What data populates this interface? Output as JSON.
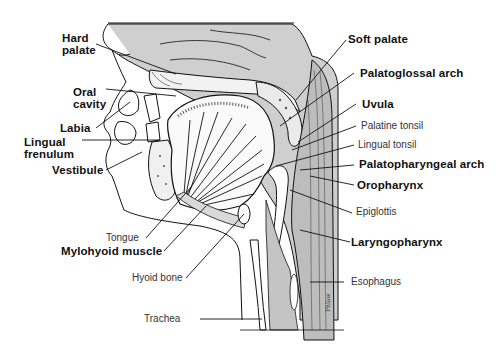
{
  "diagram": {
    "labels_left": [
      {
        "id": "hard-palate",
        "text": "Hard\npalate"
      },
      {
        "id": "oral-cavity",
        "text": "Oral\ncavity"
      },
      {
        "id": "labia",
        "text": "Labia"
      },
      {
        "id": "lingual-frenulum",
        "text": "Lingual\nfrenulum"
      },
      {
        "id": "vestibule",
        "text": "Vestibule"
      },
      {
        "id": "tongue",
        "text": "Tongue"
      },
      {
        "id": "mylohyoid-muscle",
        "text": "Mylohyoid  muscle"
      },
      {
        "id": "hyoid-bone",
        "text": "Hyoid bone"
      },
      {
        "id": "trachea",
        "text": "Trachea"
      }
    ],
    "labels_right": [
      {
        "id": "soft-palate",
        "text": "Soft palate"
      },
      {
        "id": "palatoglossal-arch",
        "text": "Palatoglossal arch"
      },
      {
        "id": "uvula",
        "text": "Uvula"
      },
      {
        "id": "palatine-tonsil",
        "text": "Palatine tonsil"
      },
      {
        "id": "lingual-tonsil",
        "text": "Lingual tonsil"
      },
      {
        "id": "palatopharyngeal-arch",
        "text": "Palatopharyngeal arch"
      },
      {
        "id": "oropharynx",
        "text": "Oropharynx"
      },
      {
        "id": "epiglottis",
        "text": "Epiglottis"
      },
      {
        "id": "laryngopharynx",
        "text": "Laryngopharynx"
      },
      {
        "id": "esophagus",
        "text": "Esophagus"
      }
    ],
    "signature": "Phlaw",
    "colors": {
      "ink": "#111111",
      "tissue_gray": "#c8c8c8",
      "light_gray": "#e2e2e2",
      "background": "#ffffff"
    }
  }
}
